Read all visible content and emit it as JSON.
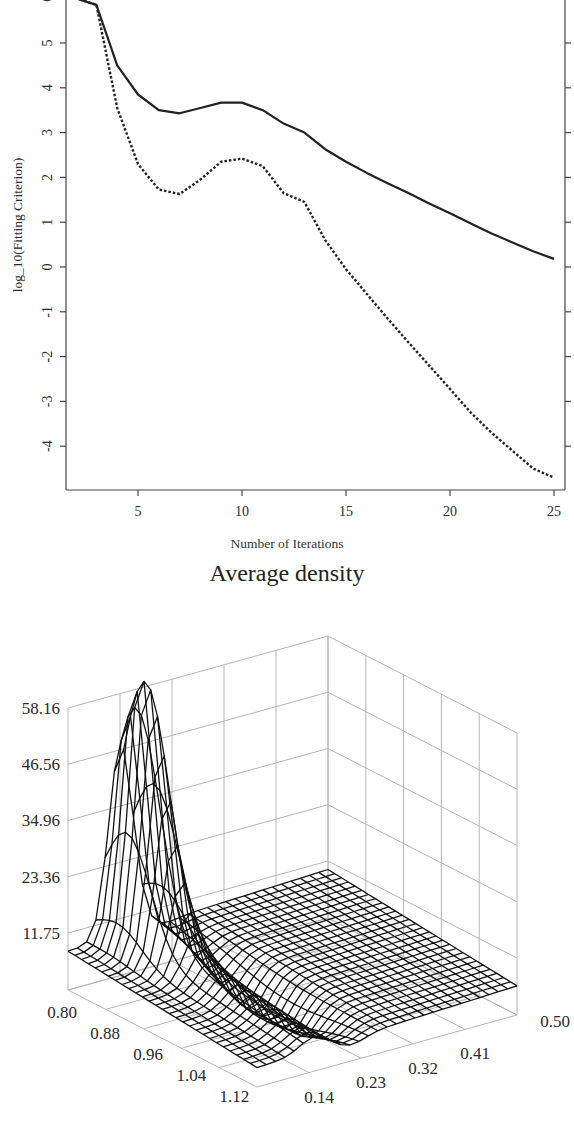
{
  "chart_data": [
    {
      "type": "line",
      "title": "",
      "xlabel": "Number of Iterations",
      "ylabel": "log_10(Fitting Criterion)",
      "xlim": [
        1.4,
        25.5
      ],
      "ylim": [
        -4.95,
        6.0
      ],
      "xticks": [
        5,
        10,
        15,
        20,
        25
      ],
      "yticks": [
        -4,
        -3,
        -2,
        -1,
        0,
        1,
        2,
        3,
        4,
        5,
        6
      ],
      "grid": false,
      "legend": null,
      "x": [
        2,
        3,
        4,
        5,
        6,
        7,
        8,
        9,
        10,
        11,
        12,
        13,
        14,
        15,
        16,
        17,
        18,
        19,
        20,
        21,
        22,
        23,
        24,
        25
      ],
      "series": [
        {
          "name": "solid",
          "style": "solid",
          "values": [
            6.0,
            5.85,
            4.5,
            3.85,
            3.5,
            3.43,
            3.55,
            3.67,
            3.67,
            3.5,
            3.2,
            3.0,
            2.63,
            2.35,
            2.1,
            1.87,
            1.65,
            1.42,
            1.2,
            0.97,
            0.75,
            0.55,
            0.35,
            0.18
          ]
        },
        {
          "name": "dashed",
          "style": "dashed",
          "values": [
            6.0,
            5.85,
            3.55,
            2.3,
            1.73,
            1.63,
            1.95,
            2.35,
            2.42,
            2.25,
            1.65,
            1.45,
            0.6,
            -0.05,
            -0.6,
            -1.15,
            -1.68,
            -2.2,
            -2.72,
            -3.25,
            -3.7,
            -4.1,
            -4.5,
            -4.7
          ]
        }
      ]
    },
    {
      "type": "surface",
      "title": "Average density",
      "zticks": [
        "11.75",
        "23.36",
        "34.96",
        "46.56",
        "58.16"
      ],
      "xticks": [
        "0.80",
        "0.88",
        "0.96",
        "1.04",
        "1.12"
      ],
      "yticks": [
        "0.14",
        "0.23",
        "0.32",
        "0.41",
        "0.50"
      ],
      "zlim": [
        0.15,
        58.16
      ],
      "peak": {
        "x": 0.92,
        "y": 0.05,
        "z": 49.5
      },
      "grid": true
    }
  ],
  "line_chart": {
    "xlabel": "Number of Iterations",
    "ylabel": "log_10(Fitting Criterion)",
    "xticks": [
      "5",
      "10",
      "15",
      "20",
      "25"
    ],
    "yticks": [
      "6",
      "5",
      "4",
      "3",
      "2",
      "1",
      "0",
      "-1",
      "-2",
      "-3",
      "-4"
    ]
  },
  "surface_chart": {
    "title": "Average density",
    "zticks": [
      "58.16",
      "46.56",
      "34.96",
      "23.36",
      "11.75"
    ],
    "xticks": [
      "0.80",
      "0.88",
      "0.96",
      "1.04",
      "1.12"
    ],
    "yticks": [
      "0.14",
      "0.23",
      "0.32",
      "0.41",
      "0.50"
    ]
  }
}
